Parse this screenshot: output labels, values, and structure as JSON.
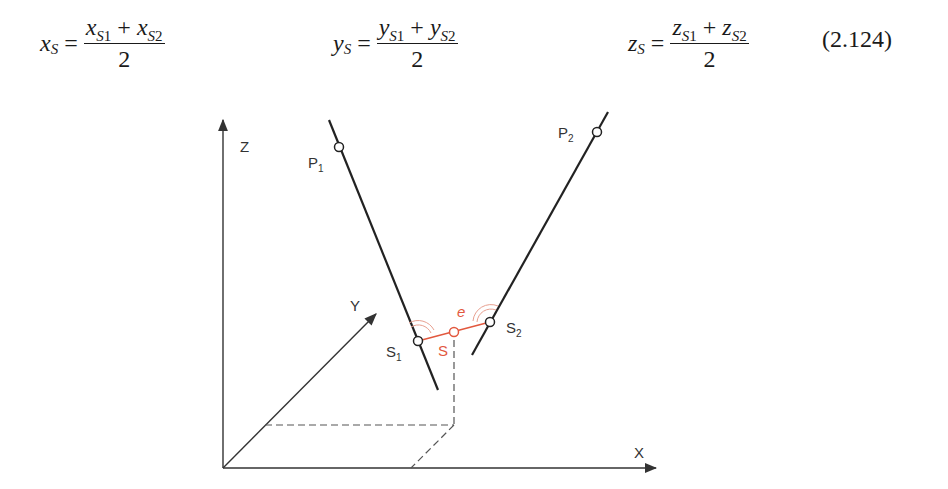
{
  "equations": {
    "number": "(2.124)",
    "items": [
      {
        "lhs_var": "x",
        "lhs_sub": "S",
        "t1_var": "x",
        "t1_sub": "S",
        "t1_idx": "1",
        "plus": "+",
        "t2_var": "x",
        "t2_sub": "S",
        "t2_idx": "2",
        "den": "2",
        "eq": "="
      },
      {
        "lhs_var": "y",
        "lhs_sub": "S",
        "t1_var": "y",
        "t1_sub": "S",
        "t1_idx": "1",
        "plus": "+",
        "t2_var": "y",
        "t2_sub": "S",
        "t2_idx": "2",
        "den": "2",
        "eq": "="
      },
      {
        "lhs_var": "z",
        "lhs_sub": "S",
        "t1_var": "z",
        "t1_sub": "S",
        "t1_idx": "1",
        "plus": "+",
        "t2_var": "z",
        "t2_sub": "S",
        "t2_idx": "2",
        "den": "2",
        "eq": "="
      }
    ]
  },
  "figure": {
    "colors": {
      "line": "#222222",
      "axis": "#333333",
      "dashed": "#555555",
      "accent": "#e2583e"
    },
    "axes": {
      "x_label": "X",
      "y_label": "Y",
      "z_label": "Z"
    },
    "points": {
      "p1": {
        "label": "P",
        "sub": "1"
      },
      "p2": {
        "label": "P",
        "sub": "2"
      },
      "s1": {
        "label": "S",
        "sub": "1"
      },
      "s2": {
        "label": "S",
        "sub": "2"
      },
      "s": {
        "label": "S"
      }
    },
    "segment_label": "e"
  }
}
